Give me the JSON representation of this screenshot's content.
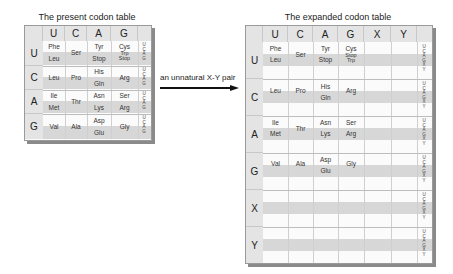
{
  "left_table": {
    "title": "The present codon table",
    "columns": [
      "U",
      "C",
      "A",
      "G"
    ],
    "rows": [
      {
        "first": "U",
        "third": "U C A G",
        "cells": [
          [
            "Phe",
            "Leu"
          ],
          [
            "Ser"
          ],
          [
            "Tyr",
            "Stop"
          ],
          [
            "Cys",
            "Trp",
            "Stop"
          ]
        ]
      },
      {
        "first": "C",
        "third": "U C A G",
        "cells": [
          [
            "Leu"
          ],
          [
            "Pro"
          ],
          [
            "His",
            "Gln"
          ],
          [
            "Arg"
          ]
        ]
      },
      {
        "first": "A",
        "third": "U C A G",
        "cells": [
          [
            "Ile",
            "Met"
          ],
          [
            "Thr"
          ],
          [
            "Asn",
            "Lys"
          ],
          [
            "Ser",
            "Arg"
          ]
        ]
      },
      {
        "first": "G",
        "third": "U C A G",
        "cells": [
          [
            "Val"
          ],
          [
            "Ala"
          ],
          [
            "Asp",
            "Glu"
          ],
          [
            "Gly"
          ]
        ]
      }
    ]
  },
  "arrow": {
    "label": "an unnatural X-Y pair"
  },
  "right_table": {
    "title": "The expanded codon table",
    "columns": [
      "U",
      "C",
      "A",
      "G",
      "X",
      "Y"
    ],
    "rows": [
      {
        "first": "U",
        "third": "U C A G X Y",
        "cells": [
          [
            "Phe",
            "Leu"
          ],
          [
            "Ser"
          ],
          [
            "Tyr",
            "Stop"
          ],
          [
            "Cys",
            "Stop",
            "Trp"
          ],
          [],
          []
        ]
      },
      {
        "first": "C",
        "third": "U C A G X Y",
        "cells": [
          [
            "Leu"
          ],
          [
            "Pro"
          ],
          [
            "His",
            "Gln"
          ],
          [
            "Arg"
          ],
          [],
          []
        ]
      },
      {
        "first": "A",
        "third": "U C A G X Y",
        "cells": [
          [
            "Ile",
            "Met"
          ],
          [
            "Thr"
          ],
          [
            "Asn",
            "Lys"
          ],
          [
            "Ser",
            "Arg"
          ],
          [],
          []
        ]
      },
      {
        "first": "G",
        "third": "U C A G X Y",
        "cells": [
          [
            "Val"
          ],
          [
            "Ala"
          ],
          [
            "Asp",
            "Glu"
          ],
          [
            "Gly"
          ],
          [],
          []
        ]
      },
      {
        "first": "X",
        "third": "U C A G X Y",
        "cells": [
          [],
          [],
          [],
          [],
          [],
          []
        ]
      },
      {
        "first": "Y",
        "third": "U C A G X Y",
        "cells": [
          [],
          [],
          [],
          [],
          [],
          []
        ]
      }
    ]
  },
  "labels": {
    "lt": {
      "r0": {
        "c0a": "Phe",
        "c0b": "Leu",
        "c1": "Ser",
        "c2a": "Tyr",
        "c2b": "Stop",
        "c3a": "Cys",
        "c3b": "Trp",
        "c3c": "Stop"
      },
      "r1": {
        "c0": "Leu",
        "c1": "Pro",
        "c2a": "His",
        "c2b": "Gln",
        "c3": "Arg"
      },
      "r2": {
        "c0a": "Ile",
        "c0b": "Met",
        "c1": "Thr",
        "c2a": "Asn",
        "c2b": "Lys",
        "c3a": "Ser",
        "c3b": "Arg"
      },
      "r3": {
        "c0": "Val",
        "c1": "Ala",
        "c2a": "Asp",
        "c2b": "Glu",
        "c3": "Gly"
      }
    },
    "rt": {
      "r0": {
        "c0a": "Phe",
        "c0b": "Leu",
        "c1": "Ser",
        "c2a": "Tyr",
        "c2b": "Stop",
        "c3a": "Cys",
        "c3b": "Stop",
        "c3c": "Trp"
      },
      "r1": {
        "c0": "Leu",
        "c1": "Pro",
        "c2a": "His",
        "c2b": "Gln",
        "c3": "Arg"
      },
      "r2": {
        "c0a": "Ile",
        "c0b": "Met",
        "c1": "Thr",
        "c2a": "Asn",
        "c2b": "Lys",
        "c3a": "Ser",
        "c3b": "Arg"
      },
      "r3": {
        "c0": "Val",
        "c1": "Ala",
        "c2a": "Asp",
        "c2b": "Glu",
        "c3": "Gly"
      }
    }
  }
}
